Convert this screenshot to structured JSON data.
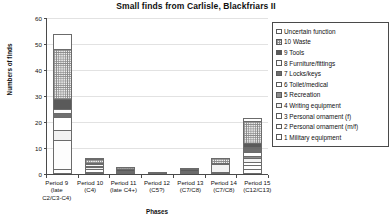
{
  "chart_data": {
    "type": "bar",
    "subtype": "stacked-column",
    "title": "Small finds from Carlisle, Blackfriars II",
    "xlabel": "Phases",
    "ylabel": "Numbers of finds",
    "ylim": [
      0,
      60
    ],
    "yticks": [
      0,
      10,
      20,
      30,
      40,
      50,
      60
    ],
    "grid": true,
    "legend_position": "right",
    "categories": [
      "Period 9 (late C2/C3-C4)",
      "Period 10 (C4)",
      "Period 11 (late C4+)",
      "Period 12 (C5?)",
      "Period 13 (C7/C8)",
      "Period 14 (C7/C8)",
      "Period 15 (C12/C13)"
    ],
    "category_lines": [
      [
        "Period 9",
        "(late",
        "C2/C3-C4)"
      ],
      [
        "Period 10",
        "(C4)",
        ""
      ],
      [
        "Period 11",
        "(late C4+)",
        ""
      ],
      [
        "Period 12",
        "(C5?)",
        ""
      ],
      [
        "Period 13",
        "(C7/C8)",
        ""
      ],
      [
        "Period 14",
        "(C7/C8)",
        ""
      ],
      [
        "Period 15",
        "(C12/C13)",
        ""
      ]
    ],
    "series": [
      {
        "name": "1 Military equipment",
        "pattern": "s1",
        "values": [
          2,
          0.5,
          0,
          0,
          0,
          0.5,
          2
        ]
      },
      {
        "name": "2 Personal ornament (m/f)",
        "pattern": "s2",
        "values": [
          11,
          1,
          0,
          0,
          0,
          0,
          1.5
        ]
      },
      {
        "name": "3 Personal ornament (f)",
        "pattern": "s3",
        "values": [
          0,
          0,
          0,
          0,
          0,
          0,
          1
        ]
      },
      {
        "name": "4 Writing equipment",
        "pattern": "s4",
        "values": [
          4,
          1,
          0.5,
          0,
          0.5,
          3,
          1.5
        ]
      },
      {
        "name": "5 Recreation",
        "pattern": "s5",
        "values": [
          0,
          0,
          0,
          0,
          0,
          0,
          1
        ]
      },
      {
        "name": "6 Toilet/medical",
        "pattern": "s6",
        "values": [
          5,
          0,
          0,
          0,
          0,
          0,
          1.5
        ]
      },
      {
        "name": "7 Locks/keys",
        "pattern": "s7",
        "values": [
          1.5,
          0.5,
          0.5,
          0,
          0.5,
          0,
          1.5
        ]
      },
      {
        "name": "8 Furniture/fittings",
        "pattern": "s8",
        "values": [
          1.5,
          0.5,
          0,
          0,
          0,
          0,
          0.5
        ]
      },
      {
        "name": "9 Tools",
        "pattern": "s9",
        "values": [
          4,
          0.5,
          0.5,
          0.5,
          0.5,
          0.5,
          1.5
        ]
      },
      {
        "name": "10 Waste",
        "pattern": "s10",
        "values": [
          19,
          1.5,
          1,
          0,
          0.5,
          2,
          8.5
        ]
      },
      {
        "name": "11 Uncertain function",
        "pattern": "s11",
        "values": [
          6,
          0.5,
          0,
          0,
          0,
          0,
          1
        ]
      }
    ],
    "totals": [
      54,
      6,
      2.5,
      0.5,
      2,
      6.5,
      21.5
    ]
  },
  "legend": {
    "items": [
      {
        "label": "Uncertain function",
        "pattern": "s11"
      },
      {
        "label": "10 Waste",
        "pattern": "s10"
      },
      {
        "label": "9 Tools",
        "pattern": "s9"
      },
      {
        "label": "8 Furniture/fittings",
        "pattern": "s8"
      },
      {
        "label": "7 Locks/keys",
        "pattern": "s7"
      },
      {
        "label": "6 Toilet/medical",
        "pattern": "s6"
      },
      {
        "label": "5 Recreation",
        "pattern": "s5"
      },
      {
        "label": "4 Writing equipment",
        "pattern": "s4"
      },
      {
        "label": "3 Personal ornament (f)",
        "pattern": "s3"
      },
      {
        "label": "2 Personal ornament (m/f)",
        "pattern": "s2"
      },
      {
        "label": "1 Military equipment",
        "pattern": "s1"
      }
    ]
  },
  "colors": {
    "axis": "#4a4a4a",
    "grid": "#e2e2e2",
    "text": "#111111",
    "plot_background": "#ffffff"
  }
}
